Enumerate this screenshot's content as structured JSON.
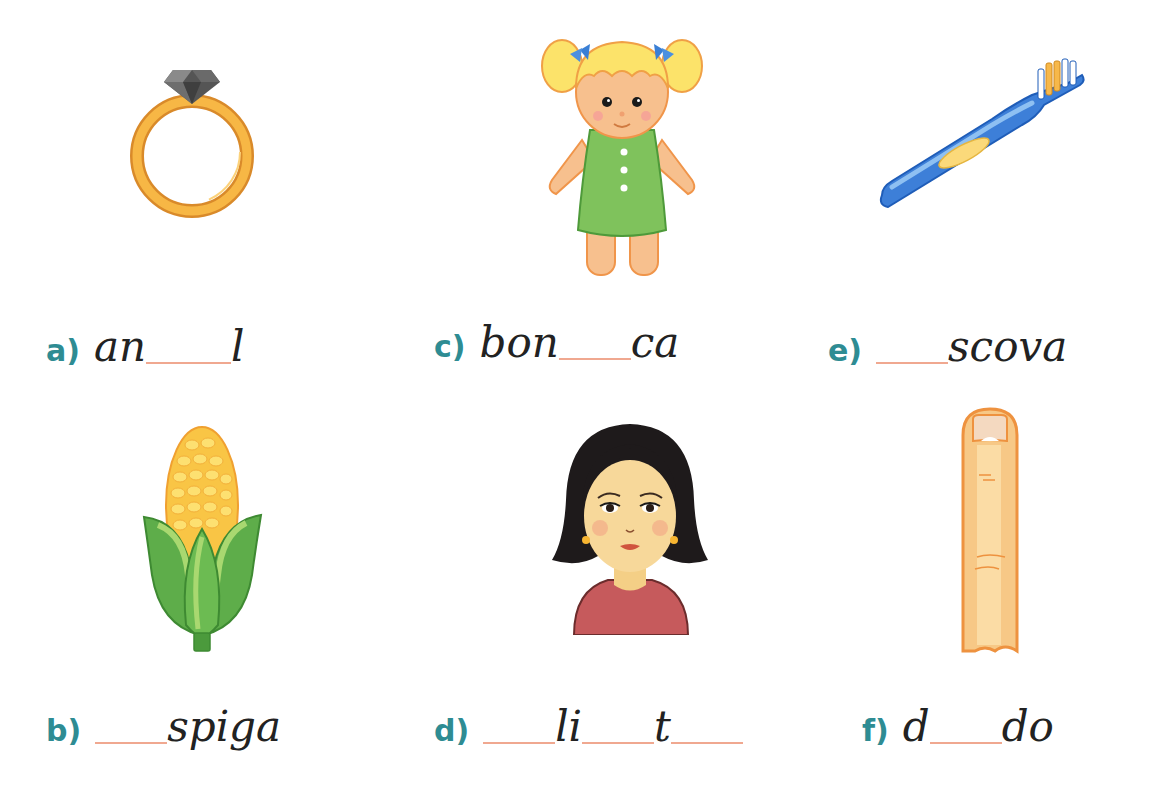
{
  "exercise": {
    "items": [
      {
        "label": "a)",
        "picture": "ring",
        "segments": [
          {
            "type": "text",
            "value": "an"
          },
          {
            "type": "blank",
            "width": 85
          },
          {
            "type": "text",
            "value": "l"
          }
        ]
      },
      {
        "label": "b)",
        "picture": "corn-cob",
        "segments": [
          {
            "type": "blank",
            "width": 72
          },
          {
            "type": "text",
            "value": "spiga"
          }
        ]
      },
      {
        "label": "c)",
        "picture": "doll",
        "segments": [
          {
            "type": "text",
            "value": "bon"
          },
          {
            "type": "blank",
            "width": 72
          },
          {
            "type": "text",
            "value": "ca"
          }
        ]
      },
      {
        "label": "d)",
        "picture": "woman-face",
        "segments": [
          {
            "type": "blank",
            "width": 72
          },
          {
            "type": "text",
            "value": "li"
          },
          {
            "type": "blank",
            "width": 72
          },
          {
            "type": "text",
            "value": "t"
          },
          {
            "type": "blank",
            "width": 72
          }
        ]
      },
      {
        "label": "e)",
        "picture": "toothbrush",
        "segments": [
          {
            "type": "blank",
            "width": 72
          },
          {
            "type": "text",
            "value": "scova"
          }
        ]
      },
      {
        "label": "f)",
        "picture": "finger",
        "segments": [
          {
            "type": "text",
            "value": "d"
          },
          {
            "type": "blank",
            "width": 72
          },
          {
            "type": "text",
            "value": "do"
          }
        ]
      }
    ],
    "labels": {
      "a": "a)",
      "b": "b)",
      "c": "c)",
      "d": "d)",
      "e": "e)",
      "f": "f)"
    },
    "text": {
      "a1": "an",
      "a2": "l",
      "b1": "spiga",
      "c1": "bon",
      "c2": "ca",
      "d1": "li",
      "d2": "t",
      "e1": "scova",
      "f1": "d",
      "f2": "do"
    },
    "colors": {
      "label": "#2e8c93",
      "blank_line": "#f0a890",
      "handwriting": "#222222"
    }
  }
}
